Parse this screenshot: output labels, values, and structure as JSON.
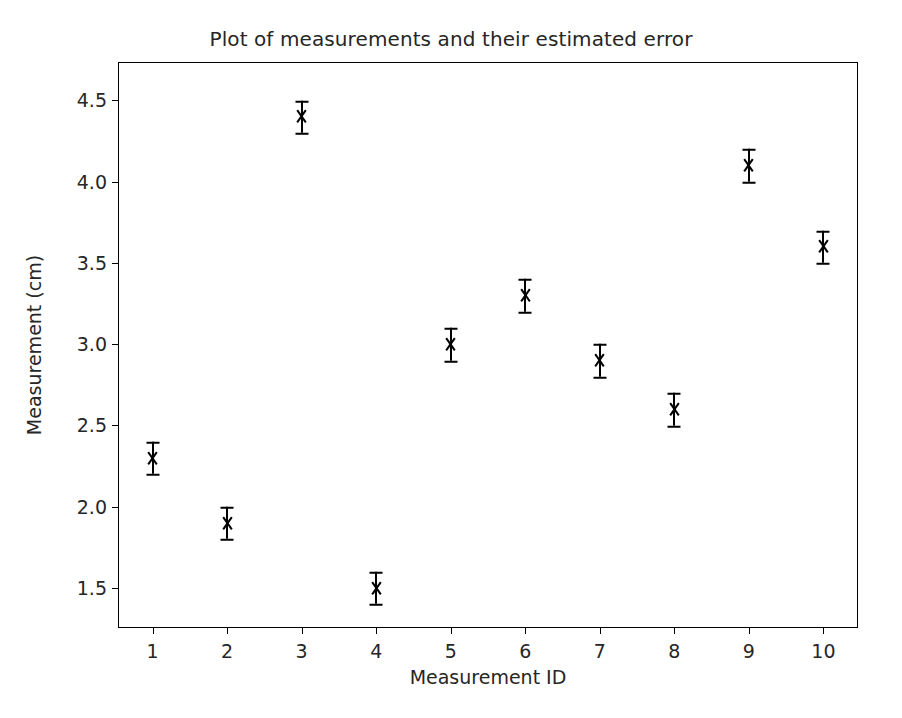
{
  "chart_data": {
    "type": "scatter",
    "title": "Plot of measurements and their estimated error",
    "xlabel": "Measurement ID",
    "ylabel": "Measurement (cm)",
    "x": [
      1,
      2,
      3,
      4,
      5,
      6,
      7,
      8,
      9,
      10
    ],
    "values": [
      2.3,
      1.9,
      4.4,
      1.5,
      3.0,
      3.3,
      2.9,
      2.6,
      4.1,
      3.6
    ],
    "yerr": [
      0.1,
      0.1,
      0.1,
      0.1,
      0.1,
      0.1,
      0.1,
      0.1,
      0.1,
      0.1
    ],
    "series": [
      {
        "name": "measurements",
        "values": [
          2.3,
          1.9,
          4.4,
          1.5,
          3.0,
          3.3,
          2.9,
          2.6,
          4.1,
          3.6
        ],
        "yerr": [
          0.1,
          0.1,
          0.1,
          0.1,
          0.1,
          0.1,
          0.1,
          0.1,
          0.1,
          0.1
        ],
        "marker": "x",
        "color": "#000000"
      }
    ],
    "xticks": [
      "1",
      "2",
      "3",
      "4",
      "5",
      "6",
      "7",
      "8",
      "9",
      "10"
    ],
    "xtick_values": [
      1,
      2,
      3,
      4,
      5,
      6,
      7,
      8,
      9,
      10
    ],
    "yticks": [
      "1.5",
      "2.0",
      "2.5",
      "3.0",
      "3.5",
      "4.0",
      "4.5"
    ],
    "ytick_values": [
      1.5,
      2.0,
      2.5,
      3.0,
      3.5,
      4.0,
      4.5
    ],
    "xlim": [
      0.55,
      10.45
    ],
    "ylim": [
      1.26,
      4.73
    ],
    "grid": false,
    "legend": null,
    "legend_position": "none",
    "marker_color": "#000000",
    "errorbar_color": "#000000",
    "background_color": "#ffffff",
    "axes_color": "#000000",
    "text_color": "#262626"
  }
}
